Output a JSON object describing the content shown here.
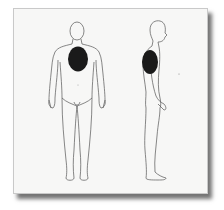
{
  "figure": {
    "views": [
      {
        "name": "front",
        "highlight": "chest"
      },
      {
        "name": "side",
        "highlight": "chest"
      }
    ],
    "colors": {
      "background": "#ffffff",
      "card": "#f7f7f6",
      "outline": "#555555",
      "highlight": "#1a1a1a"
    }
  }
}
